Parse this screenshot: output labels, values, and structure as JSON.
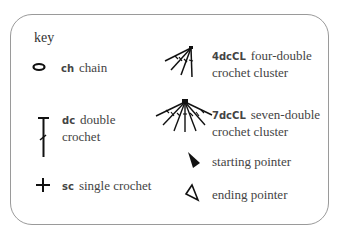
{
  "title": "key",
  "entries": [
    {
      "symbol": "chain-oval",
      "abbr": "ch",
      "line1": "chain",
      "line2": ""
    },
    {
      "symbol": "double-crochet-t",
      "abbr": "dc",
      "line1": "double",
      "line2": "crochet"
    },
    {
      "symbol": "single-crochet-plus",
      "abbr": "sc",
      "line1": "single crochet",
      "line2": ""
    },
    {
      "symbol": "four-dc-cluster",
      "abbr": "4dcCL",
      "line1": "four-double",
      "line2": "crochet cluster"
    },
    {
      "symbol": "seven-dc-cluster",
      "abbr": "7dcCL",
      "line1": "seven-double",
      "line2": "crochet cluster"
    },
    {
      "symbol": "filled-triangle-pointer",
      "abbr": "",
      "line1": "starting pointer",
      "line2": ""
    },
    {
      "symbol": "outline-triangle-pointer",
      "abbr": "",
      "line1": "ending pointer",
      "line2": ""
    }
  ],
  "colors": {
    "ink": "#111111",
    "text": "#444444",
    "border": "#9a9a9a",
    "background": "#ffffff"
  }
}
